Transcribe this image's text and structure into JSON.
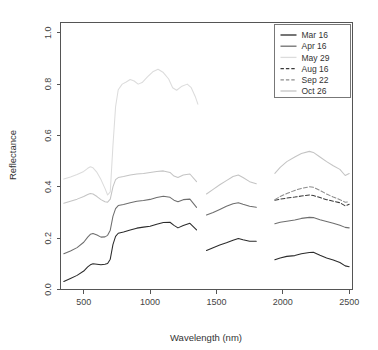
{
  "chart_data": {
    "type": "line",
    "title": "",
    "xlabel": "Wavelength (nm)",
    "ylabel": "Reflectance",
    "xlim": [
      325,
      2525
    ],
    "ylim": [
      0.0,
      1.04
    ],
    "xticks": [
      500,
      1000,
      1500,
      2000,
      2500
    ],
    "xtick_labels": [
      "500",
      "1000",
      "1500",
      "2000",
      "2500"
    ],
    "yticks": [
      0.0,
      0.2,
      0.4,
      0.6,
      0.8,
      1.0
    ],
    "ytick_labels": [
      "0.0",
      "0.2",
      "0.4",
      "0.6",
      "0.8",
      "1.0"
    ],
    "grid": false,
    "legend_position": "top-right",
    "gaps_nm": [
      [
        1350,
        1425
      ],
      [
        1800,
        1940
      ]
    ],
    "series": [
      {
        "name": "Mar 16",
        "color": "#2b2b2b",
        "dash": "none",
        "points": [
          [
            350,
            0.031
          ],
          [
            400,
            0.043
          ],
          [
            450,
            0.055
          ],
          [
            500,
            0.072
          ],
          [
            530,
            0.088
          ],
          [
            550,
            0.096
          ],
          [
            570,
            0.1
          ],
          [
            600,
            0.098
          ],
          [
            630,
            0.096
          ],
          [
            660,
            0.098
          ],
          [
            680,
            0.101
          ],
          [
            700,
            0.118
          ],
          [
            720,
            0.175
          ],
          [
            740,
            0.207
          ],
          [
            760,
            0.219
          ],
          [
            800,
            0.224
          ],
          [
            850,
            0.232
          ],
          [
            900,
            0.239
          ],
          [
            950,
            0.243
          ],
          [
            1000,
            0.246
          ],
          [
            1050,
            0.254
          ],
          [
            1100,
            0.261
          ],
          [
            1150,
            0.262
          ],
          [
            1180,
            0.25
          ],
          [
            1210,
            0.24
          ],
          [
            1250,
            0.249
          ],
          [
            1300,
            0.258
          ],
          [
            1350,
            0.232
          ],
          [
            1425,
            0.152
          ],
          [
            1475,
            0.163
          ],
          [
            1525,
            0.173
          ],
          [
            1575,
            0.182
          ],
          [
            1625,
            0.192
          ],
          [
            1665,
            0.199
          ],
          [
            1700,
            0.194
          ],
          [
            1750,
            0.188
          ],
          [
            1800,
            0.188
          ],
          [
            1940,
            0.116
          ],
          [
            1980,
            0.123
          ],
          [
            2030,
            0.129
          ],
          [
            2090,
            0.132
          ],
          [
            2140,
            0.139
          ],
          [
            2200,
            0.144
          ],
          [
            2230,
            0.145
          ],
          [
            2280,
            0.133
          ],
          [
            2330,
            0.123
          ],
          [
            2380,
            0.115
          ],
          [
            2430,
            0.105
          ],
          [
            2470,
            0.092
          ],
          [
            2500,
            0.089
          ]
        ]
      },
      {
        "name": "Apr 16",
        "color": "#6e6e6e",
        "dash": "none",
        "points": [
          [
            350,
            0.139
          ],
          [
            400,
            0.15
          ],
          [
            450,
            0.163
          ],
          [
            500,
            0.184
          ],
          [
            530,
            0.204
          ],
          [
            550,
            0.215
          ],
          [
            570,
            0.218
          ],
          [
            600,
            0.212
          ],
          [
            630,
            0.204
          ],
          [
            660,
            0.205
          ],
          [
            680,
            0.211
          ],
          [
            700,
            0.231
          ],
          [
            720,
            0.285
          ],
          [
            740,
            0.315
          ],
          [
            760,
            0.327
          ],
          [
            800,
            0.331
          ],
          [
            850,
            0.338
          ],
          [
            900,
            0.344
          ],
          [
            950,
            0.347
          ],
          [
            1000,
            0.351
          ],
          [
            1050,
            0.358
          ],
          [
            1100,
            0.363
          ],
          [
            1150,
            0.359
          ],
          [
            1180,
            0.348
          ],
          [
            1210,
            0.342
          ],
          [
            1250,
            0.35
          ],
          [
            1300,
            0.352
          ],
          [
            1350,
            0.32
          ],
          [
            1425,
            0.29
          ],
          [
            1475,
            0.3
          ],
          [
            1525,
            0.312
          ],
          [
            1575,
            0.324
          ],
          [
            1625,
            0.334
          ],
          [
            1665,
            0.338
          ],
          [
            1700,
            0.332
          ],
          [
            1750,
            0.324
          ],
          [
            1800,
            0.32
          ],
          [
            1940,
            0.256
          ],
          [
            1980,
            0.262
          ],
          [
            2030,
            0.266
          ],
          [
            2090,
            0.271
          ],
          [
            2140,
            0.277
          ],
          [
            2200,
            0.281
          ],
          [
            2230,
            0.28
          ],
          [
            2280,
            0.272
          ],
          [
            2330,
            0.265
          ],
          [
            2380,
            0.258
          ],
          [
            2430,
            0.25
          ],
          [
            2470,
            0.242
          ],
          [
            2500,
            0.24
          ]
        ]
      },
      {
        "name": "May 29",
        "color": "#dcdcdc",
        "dash": "none",
        "points": [
          [
            350,
            0.43
          ],
          [
            400,
            0.438
          ],
          [
            450,
            0.448
          ],
          [
            500,
            0.46
          ],
          [
            530,
            0.472
          ],
          [
            550,
            0.478
          ],
          [
            570,
            0.474
          ],
          [
            600,
            0.456
          ],
          [
            630,
            0.428
          ],
          [
            660,
            0.394
          ],
          [
            680,
            0.368
          ],
          [
            700,
            0.38
          ],
          [
            720,
            0.56
          ],
          [
            740,
            0.712
          ],
          [
            760,
            0.778
          ],
          [
            790,
            0.8
          ],
          [
            820,
            0.808
          ],
          [
            850,
            0.818
          ],
          [
            880,
            0.812
          ],
          [
            910,
            0.8
          ],
          [
            940,
            0.806
          ],
          [
            980,
            0.828
          ],
          [
            1020,
            0.848
          ],
          [
            1060,
            0.858
          ],
          [
            1100,
            0.845
          ],
          [
            1140,
            0.82
          ],
          [
            1170,
            0.786
          ],
          [
            1200,
            0.776
          ],
          [
            1240,
            0.792
          ],
          [
            1280,
            0.8
          ],
          [
            1310,
            0.786
          ],
          [
            1340,
            0.752
          ],
          [
            1360,
            0.722
          ]
        ]
      },
      {
        "name": "Aug 16",
        "color": "#3a3a3a",
        "dash": "dash",
        "points": [
          [
            1940,
            0.348
          ],
          [
            1980,
            0.352
          ],
          [
            2030,
            0.356
          ],
          [
            2090,
            0.36
          ],
          [
            2140,
            0.364
          ],
          [
            2200,
            0.368
          ],
          [
            2230,
            0.366
          ],
          [
            2280,
            0.358
          ],
          [
            2330,
            0.35
          ],
          [
            2380,
            0.344
          ],
          [
            2430,
            0.338
          ],
          [
            2470,
            0.326
          ],
          [
            2500,
            0.332
          ]
        ]
      },
      {
        "name": "Sep 22",
        "color": "#8c8c8c",
        "dash": "dash",
        "points": [
          [
            1940,
            0.35
          ],
          [
            1980,
            0.362
          ],
          [
            2030,
            0.374
          ],
          [
            2090,
            0.386
          ],
          [
            2140,
            0.394
          ],
          [
            2200,
            0.4
          ],
          [
            2230,
            0.398
          ],
          [
            2280,
            0.386
          ],
          [
            2330,
            0.372
          ],
          [
            2380,
            0.36
          ],
          [
            2430,
            0.35
          ],
          [
            2470,
            0.34
          ],
          [
            2500,
            0.342
          ]
        ]
      },
      {
        "name": "Oct 26",
        "color": "#c4c4c4",
        "dash": "none",
        "points": [
          [
            350,
            0.336
          ],
          [
            400,
            0.344
          ],
          [
            450,
            0.352
          ],
          [
            500,
            0.362
          ],
          [
            530,
            0.37
          ],
          [
            550,
            0.374
          ],
          [
            570,
            0.372
          ],
          [
            600,
            0.362
          ],
          [
            630,
            0.35
          ],
          [
            660,
            0.342
          ],
          [
            680,
            0.34
          ],
          [
            700,
            0.352
          ],
          [
            720,
            0.4
          ],
          [
            740,
            0.428
          ],
          [
            760,
            0.436
          ],
          [
            800,
            0.44
          ],
          [
            850,
            0.446
          ],
          [
            900,
            0.45
          ],
          [
            950,
            0.452
          ],
          [
            1000,
            0.456
          ],
          [
            1050,
            0.46
          ],
          [
            1100,
            0.462
          ],
          [
            1150,
            0.456
          ],
          [
            1180,
            0.442
          ],
          [
            1210,
            0.436
          ],
          [
            1250,
            0.446
          ],
          [
            1300,
            0.45
          ],
          [
            1350,
            0.42
          ],
          [
            1425,
            0.372
          ],
          [
            1475,
            0.39
          ],
          [
            1525,
            0.408
          ],
          [
            1575,
            0.424
          ],
          [
            1625,
            0.44
          ],
          [
            1665,
            0.446
          ],
          [
            1700,
            0.436
          ],
          [
            1750,
            0.42
          ],
          [
            1800,
            0.412
          ],
          [
            1940,
            0.452
          ],
          [
            1980,
            0.476
          ],
          [
            2030,
            0.498
          ],
          [
            2090,
            0.516
          ],
          [
            2140,
            0.53
          ],
          [
            2200,
            0.538
          ],
          [
            2230,
            0.534
          ],
          [
            2280,
            0.516
          ],
          [
            2330,
            0.498
          ],
          [
            2380,
            0.482
          ],
          [
            2430,
            0.468
          ],
          [
            2470,
            0.444
          ],
          [
            2500,
            0.452
          ]
        ]
      }
    ]
  },
  "legend": {
    "entries": [
      {
        "label": "Mar 16"
      },
      {
        "label": "Apr 16"
      },
      {
        "label": "May 29"
      },
      {
        "label": "Aug 16"
      },
      {
        "label": "Sep 22"
      },
      {
        "label": "Oct 26"
      }
    ]
  }
}
